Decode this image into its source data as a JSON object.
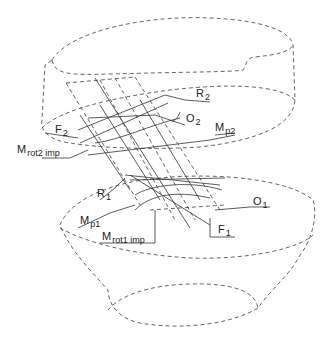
{
  "diagram": {
    "type": "mechanical force/moment schematic between two bodies (upper and lower)",
    "labels": {
      "R2": {
        "main": "R",
        "sub": "2"
      },
      "O2": {
        "main": "O",
        "sub": "2"
      },
      "F2": {
        "main": "F",
        "sub": "2"
      },
      "Mp2": {
        "main": "M",
        "sub": "p2"
      },
      "Mrot2imp": {
        "main": "M",
        "sub": "rot2 imp"
      },
      "R1": {
        "main": "R",
        "sub": "1"
      },
      "O1": {
        "main": "O",
        "sub": "1"
      },
      "Mp1": {
        "main": "M",
        "sub": "p1"
      },
      "Mrot1imp": {
        "main": "M",
        "sub": "rot1 imp"
      },
      "F1": {
        "main": "F",
        "sub": "1"
      }
    },
    "colors": {
      "line": "#333333",
      "dashed": "#555555",
      "background": "#ffffff"
    }
  }
}
